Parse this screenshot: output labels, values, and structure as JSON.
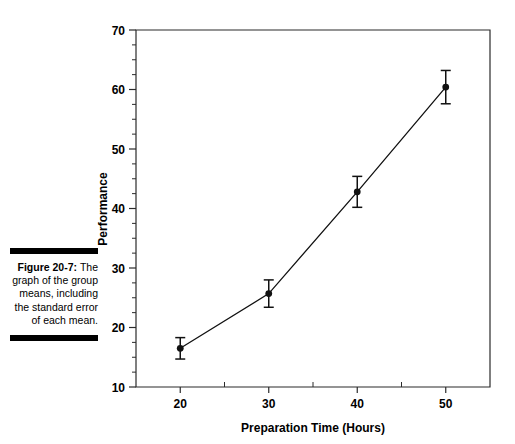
{
  "caption": {
    "label": "Figure 20-7:",
    "text": "The graph of the group means, including the standard error of each mean."
  },
  "chart_data": {
    "type": "line",
    "title": "",
    "xlabel": "Preparation Time (Hours)",
    "ylabel": "Performance",
    "x": [
      20,
      30,
      40,
      50
    ],
    "values": [
      16.5,
      25.7,
      42.8,
      60.4
    ],
    "errors": [
      1.8,
      2.3,
      2.6,
      2.8
    ],
    "error_type": "standard error of the mean",
    "xlim": [
      15,
      55
    ],
    "ylim": [
      10,
      70
    ],
    "xticks": [
      20,
      30,
      40,
      50
    ],
    "xtick_labels": [
      "20",
      "30",
      "40",
      "50"
    ],
    "yticks": [
      10,
      20,
      30,
      40,
      50,
      60,
      70
    ],
    "ytick_labels": [
      "10",
      "20",
      "30",
      "40",
      "50",
      "60",
      "70"
    ],
    "y_minor_ticks": [
      12.5,
      15,
      17.5,
      22.5,
      25,
      27.5,
      32.5,
      35,
      37.5,
      42.5,
      45,
      47.5,
      52.5,
      55,
      57.5,
      62.5,
      65,
      67.5
    ],
    "x_minor_ticks": [
      25,
      35,
      45
    ],
    "grid": false,
    "legend": false,
    "series": [
      {
        "name": "Group means",
        "values": [
          16.5,
          25.7,
          42.8,
          60.4
        ]
      }
    ]
  }
}
